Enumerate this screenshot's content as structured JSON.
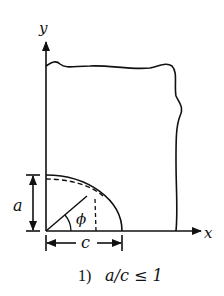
{
  "diagram": {
    "axes": {
      "x_label": "x",
      "y_label": "y"
    },
    "dimensions": {
      "height_label": "a",
      "width_label": "c",
      "angle_label": "ϕ"
    },
    "caption": {
      "number": "1)",
      "condition": "a/c ≤ 1"
    },
    "colors": {
      "stroke": "#111111",
      "background": "#ffffff"
    }
  }
}
